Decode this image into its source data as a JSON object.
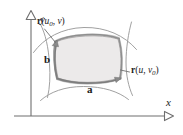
{
  "figure": {
    "type": "math-diagram",
    "background_color": "#ffffff",
    "axes": {
      "x_label": "x",
      "y_label": "y",
      "axis_color": "#6b6b6b",
      "arrowhead_style": "open-triangle",
      "origin": {
        "x": 31,
        "y": 116
      }
    },
    "patch": {
      "fill_color": "#eeeeee",
      "edge_color": "#9a9a9a",
      "shadow_color": "#b9b9b9",
      "grid_curve_color": "#8d8d8d"
    },
    "labels": {
      "curve_u0_v": {
        "prefix": "r",
        "open": "(",
        "var1": "u",
        "sub1": "0",
        "sep": ", ",
        "var2": "v",
        "sub2": "",
        "close": ")",
        "full_text": "r(u0, v)"
      },
      "curve_u_v0": {
        "prefix": "r",
        "open": "(",
        "var1": "u",
        "sub1": "",
        "sep": ", ",
        "var2": "v",
        "sub2": "0",
        "close": ")",
        "full_text": "r(u, v0)"
      },
      "vector_a": "a",
      "vector_b": "b"
    }
  }
}
